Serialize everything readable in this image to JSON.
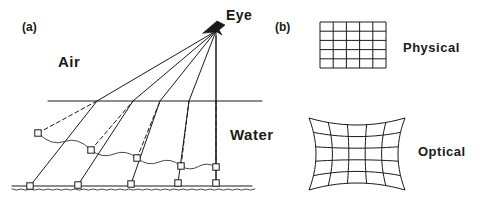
{
  "figure": {
    "width": 491,
    "height": 202,
    "background": "#ffffff",
    "ink_color": "#1a1a1a"
  },
  "panel_a": {
    "tag": "(a)",
    "labels": {
      "air": "Air",
      "water": "Water",
      "eye": "Eye"
    },
    "eye_point": {
      "x": 216,
      "y": 31
    },
    "water_surface": {
      "y": 101,
      "x_start": 48,
      "x_end": 262
    },
    "bottom_line": {
      "y": 186,
      "x_start": 12,
      "x_end": 252
    },
    "vertical_axis": {
      "x": 216,
      "y_top": 36,
      "y_bottom": 186
    },
    "real_markers": [
      {
        "x": 30,
        "y": 186
      },
      {
        "x": 78,
        "y": 185
      },
      {
        "x": 131,
        "y": 184
      },
      {
        "x": 178,
        "y": 183
      },
      {
        "x": 216,
        "y": 183
      }
    ],
    "apparent_markers": [
      {
        "x": 38,
        "y": 133
      },
      {
        "x": 91,
        "y": 150
      },
      {
        "x": 137,
        "y": 158
      },
      {
        "x": 181,
        "y": 166
      },
      {
        "x": 216,
        "y": 167
      }
    ],
    "surface_hit_points": [
      {
        "x": 97,
        "y": 101
      },
      {
        "x": 133,
        "y": 101
      },
      {
        "x": 160,
        "y": 101
      },
      {
        "x": 189,
        "y": 101
      },
      {
        "x": 216,
        "y": 101
      }
    ],
    "icons": {
      "eye": "eye-icon"
    },
    "line_styles": {
      "real_ray": "solid",
      "apparent_ray": "dashed",
      "seabed": "wavy"
    }
  },
  "panel_b": {
    "tag": "(b)",
    "grids": [
      {
        "name": "physical",
        "label": "Physical",
        "distortion": "none",
        "rows": 5,
        "cols": 5,
        "box": {
          "x": 320,
          "y": 22,
          "w": 66,
          "h": 46
        }
      },
      {
        "name": "optical",
        "label": "Optical",
        "distortion": "pincushion",
        "rows": 5,
        "cols": 5,
        "bow": 7,
        "box": {
          "x": 309,
          "y": 118,
          "w": 96,
          "h": 72
        }
      }
    ]
  }
}
